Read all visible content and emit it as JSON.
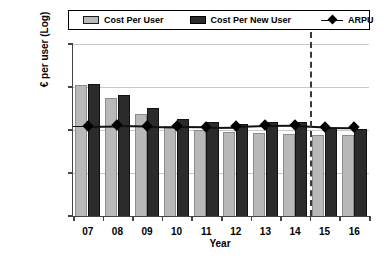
{
  "chart_data": {
    "type": "bar",
    "title": "",
    "xlabel": "Year",
    "ylabel": "€ per user (Log)",
    "yscale": "log",
    "ylim": [
      1,
      10000
    ],
    "yticks": [
      1,
      10,
      100,
      1000,
      10000
    ],
    "ytick_labels": [
      "1",
      "10",
      "100",
      "1,000",
      "10,000"
    ],
    "grid": true,
    "legend_position": "top",
    "categories": [
      "07",
      "08",
      "09",
      "10",
      "11",
      "12",
      "13",
      "14",
      "15",
      "16"
    ],
    "series": [
      {
        "name": "Cost Per User",
        "type": "bar",
        "color": "#b9b9b9",
        "values": [
          1100,
          550,
          240,
          125,
          100,
          90,
          85,
          82,
          78,
          75
        ]
      },
      {
        "name": "Cost Per New User",
        "type": "bar",
        "color": "#2b2b2b",
        "values": [
          1150,
          650,
          320,
          185,
          150,
          140,
          150,
          150,
          110,
          105
        ]
      },
      {
        "name": "ARPU",
        "type": "line",
        "color": "#000000",
        "marker": "diamond",
        "values": [
          125,
          128,
          125,
          122,
          120,
          122,
          128,
          130,
          120,
          118
        ]
      }
    ],
    "annotations": [
      {
        "name": "forecast-divider",
        "type": "vertical-dashed-line",
        "between": [
          "14",
          "15"
        ]
      }
    ]
  },
  "legend": {
    "items": [
      {
        "label": "Cost Per User",
        "swatch": "light-gray-square-icon"
      },
      {
        "label": "Cost Per New User",
        "swatch": "dark-gray-square-icon"
      },
      {
        "label": "ARPU",
        "swatch": "diamond-marker-icon"
      }
    ]
  }
}
